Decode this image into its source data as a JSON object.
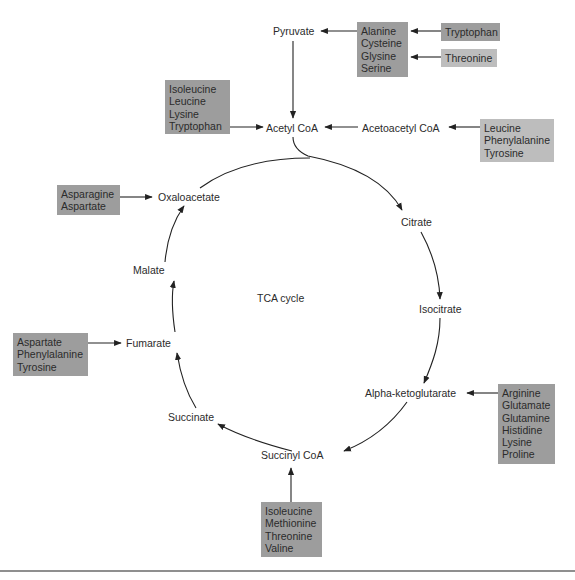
{
  "diagram": {
    "title": "TCA cycle",
    "cycle_intermediates": {
      "acetyl_coa": "Acetyl CoA",
      "citrate": "Citrate",
      "isocitrate": "Isocitrate",
      "alpha_ketoglutarate": "Alpha-ketoglutarate",
      "succinyl_coa": "Succinyl CoA",
      "succinate": "Succinate",
      "fumarate": "Fumarate",
      "malate": "Malate",
      "oxaloacetate": "Oxaloacetate"
    },
    "other_nodes": {
      "pyruvate": "Pyruvate",
      "acetoacetyl_coa": "Acetoacetyl CoA"
    },
    "amino_acid_boxes": {
      "to_pyruvate": {
        "items": [
          "Alanine",
          "Cysteine",
          "Glysine",
          "Serine"
        ],
        "shade": "dark"
      },
      "tryptophan_to_alanine": {
        "items": [
          "Tryptophan"
        ],
        "shade": "dark"
      },
      "threonine_to_glycine": {
        "items": [
          "Threonine"
        ],
        "shade": "light"
      },
      "to_acetyl_coa": {
        "items": [
          "Isoleucine",
          "Leucine",
          "Lysine",
          "Tryptophan"
        ],
        "shade": "dark"
      },
      "to_acetoacetyl_coa": {
        "items": [
          "Leucine",
          "Phenylalanine",
          "Tyrosine"
        ],
        "shade": "light"
      },
      "to_oxaloacetate": {
        "items": [
          "Asparagine",
          "Aspartate"
        ],
        "shade": "dark"
      },
      "to_fumarate": {
        "items": [
          "Aspartate",
          "Phenylalanine",
          "Tyrosine"
        ],
        "shade": "dark"
      },
      "to_alpha_ketoglutarate": {
        "items": [
          "Arginine",
          "Glutamate",
          "Glutamine",
          "Histidine",
          "Lysine",
          "Proline"
        ],
        "shade": "dark"
      },
      "to_succinyl_coa": {
        "items": [
          "Isoleucine",
          "Methionine",
          "Threonine",
          "Valine"
        ],
        "shade": "dark"
      }
    },
    "colors": {
      "box_dark": "#9d9d9d",
      "box_light": "#bdbdbd",
      "line": "#222222",
      "text": "#2b2b2b"
    }
  }
}
